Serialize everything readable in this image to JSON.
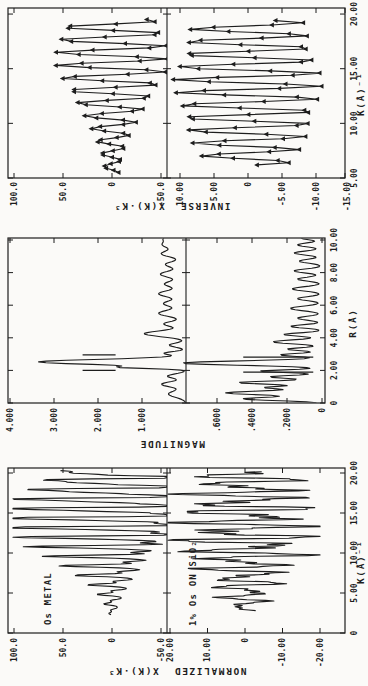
{
  "figure": {
    "kind": "scanned-exafs-figure",
    "background": "#fbfaf8",
    "ink": "#1d1d1d",
    "rotation_note": "figure printed rotated 90deg counterclockwise on the page"
  },
  "chart_data": [
    {
      "id": "normalized",
      "type": "line",
      "x_label": "K(Å)⁻¹",
      "x_range": [
        0,
        20.6
      ],
      "x_ticks": [
        0,
        5,
        10,
        15,
        20
      ],
      "x_tick_labels": [
        "0",
        "5.00",
        "10.00",
        "15.00",
        "20.00"
      ],
      "y_label": "NORMALIZED  X(K)·K³",
      "subplots": [
        {
          "id": "os-metal",
          "annotation": "Os METAL",
          "y_ticks": [
            100,
            50,
            0,
            -50
          ],
          "y_tick_labels": [
            "100.0",
            "50.0",
            "0",
            "-50.0"
          ],
          "y_range": [
            101.9,
            -56.1
          ],
          "series": {
            "kind": "exafs-oscillation",
            "k": [
              2.3,
              20.3,
              0.08
            ],
            "components": [
              [
                1.17,
                1.0,
                0.4
              ],
              [
                0.6,
                0.5,
                2.0
              ],
              [
                0.4,
                0.22,
                1.1
              ]
            ],
            "envelope": [
              [
                2.3,
                2
              ],
              [
                3,
                4
              ],
              [
                4,
                7
              ],
              [
                5,
                11
              ],
              [
                6,
                16
              ],
              [
                7,
                22
              ],
              [
                8,
                30
              ],
              [
                9,
                38
              ],
              [
                10,
                47
              ],
              [
                11,
                58
              ],
              [
                12,
                70
              ],
              [
                13,
                82
              ],
              [
                14,
                92
              ],
              [
                15,
                97
              ],
              [
                16,
                90
              ],
              [
                17,
                84
              ],
              [
                18,
                80
              ],
              [
                19,
                74
              ],
              [
                20.3,
                64
              ]
            ],
            "clamp": [
              -56,
              101
            ]
          }
        },
        {
          "id": "os-on-sio2",
          "annotation": "1% Os ON SiO₂",
          "y_ticks": [
            20,
            10,
            0,
            -10,
            -20
          ],
          "y_tick_labels": [
            "20.00",
            "10.00",
            "0",
            "-10.00",
            "-20.00"
          ],
          "y_range": [
            20.8,
            -26.7
          ],
          "series": {
            "kind": "exafs-oscillation",
            "k": [
              2.8,
              20.2,
              0.08
            ],
            "components": [
              [
                1.17,
                1.0,
                2.6
              ],
              [
                0.72,
                0.55,
                0.9
              ],
              [
                0.3,
                0.35,
                2.2
              ]
            ],
            "envelope": [
              [
                2.8,
                2.5
              ],
              [
                4,
                4.5
              ],
              [
                6,
                6.5
              ],
              [
                8,
                9
              ],
              [
                10,
                12
              ],
              [
                12,
                14.5
              ],
              [
                14,
                14.5
              ],
              [
                15,
                13.5
              ],
              [
                16,
                13
              ],
              [
                17,
                12.5
              ],
              [
                18,
                12
              ],
              [
                19,
                11
              ],
              [
                20.2,
                9.5
              ]
            ],
            "clamp": [
              -20,
              20.5
            ]
          }
        }
      ]
    },
    {
      "id": "magnitude",
      "type": "line",
      "x_label": "R(Å)",
      "x_range": [
        0,
        10.12
      ],
      "x_ticks": [
        0,
        2,
        4,
        6,
        8,
        10
      ],
      "x_tick_labels": [
        "0",
        "2.00",
        "4.00",
        "6.00",
        "8.00",
        "10.00"
      ],
      "y_label": "MAGNITUDE",
      "subplots": [
        {
          "id": "os-metal-ft",
          "annotation": "",
          "y_ticks": [
            4,
            3,
            2,
            1
          ],
          "y_tick_labels": [
            "4.000",
            "3.000",
            "2.000",
            "1.000"
          ],
          "y_range": [
            4.05,
            0
          ],
          "series": {
            "kind": "gaussian-peaks",
            "r": [
              0.02,
              10.12,
              0.05
            ],
            "peaks": [
              [
                0.55,
                0.4,
                0.2
              ],
              [
                1.15,
                0.55,
                0.16
              ],
              [
                1.65,
                0.42,
                0.13
              ],
              [
                2.18,
                1.25,
                0.07
              ],
              [
                2.52,
                3.35,
                0.155
              ],
              [
                3.05,
                0.5,
                0.1
              ],
              [
                3.55,
                0.38,
                0.13
              ],
              [
                4.25,
                0.95,
                0.18
              ],
              [
                4.85,
                0.5,
                0.16
              ],
              [
                5.5,
                0.62,
                0.2
              ],
              [
                6.1,
                0.5,
                0.18
              ],
              [
                6.7,
                0.62,
                0.2
              ],
              [
                7.3,
                0.48,
                0.18
              ],
              [
                7.9,
                0.58,
                0.2
              ],
              [
                8.5,
                0.46,
                0.18
              ],
              [
                9.15,
                0.55,
                0.2
              ],
              [
                9.7,
                0.5,
                0.2
              ],
              [
                10.12,
                0.45,
                0.18
              ]
            ]
          },
          "window_bars": [
            {
              "r": 2.0,
              "y": [
                1.6,
                2.35
              ]
            },
            {
              "r": 2.95,
              "y": [
                1.6,
                2.35
              ]
            }
          ]
        },
        {
          "id": "os-on-sio2-ft",
          "annotation": "",
          "y_ticks": [
            0.6,
            0.4,
            0.2,
            0
          ],
          "y_tick_labels": [
            ".6000",
            ".4000",
            ".2000",
            "0"
          ],
          "y_range": [
            0.78,
            -0.02
          ],
          "series": {
            "kind": "gaussian-peaks",
            "r": [
              0.02,
              10.12,
              0.05
            ],
            "peaks": [
              [
                0.25,
                0.45,
                0.1
              ],
              [
                0.62,
                0.55,
                0.12
              ],
              [
                0.95,
                0.32,
                0.08
              ],
              [
                1.25,
                0.48,
                0.1
              ],
              [
                1.6,
                0.3,
                0.09
              ],
              [
                1.95,
                0.36,
                0.08
              ],
              [
                2.45,
                0.8,
                0.13
              ],
              [
                2.95,
                0.24,
                0.09
              ],
              [
                3.3,
                0.2,
                0.09
              ],
              [
                3.75,
                0.28,
                0.12
              ],
              [
                4.2,
                0.22,
                0.1
              ],
              [
                4.7,
                0.18,
                0.1
              ],
              [
                5.2,
                0.14,
                0.12
              ],
              [
                5.8,
                0.18,
                0.14
              ],
              [
                6.4,
                0.14,
                0.12
              ],
              [
                7.0,
                0.17,
                0.13
              ],
              [
                7.6,
                0.14,
                0.12
              ],
              [
                8.1,
                0.16,
                0.12
              ],
              [
                8.7,
                0.13,
                0.12
              ],
              [
                9.2,
                0.16,
                0.12
              ],
              [
                9.7,
                0.14,
                0.12
              ],
              [
                10.12,
                0.12,
                0.1
              ]
            ]
          },
          "window_bars": [
            {
              "r": 1.9,
              "y": [
                0.05,
                0.45
              ]
            },
            {
              "r": 2.82,
              "y": [
                0.05,
                0.45
              ]
            }
          ]
        }
      ]
    },
    {
      "id": "inverse",
      "type": "line+marker",
      "x_label": "K(Å)⁻¹",
      "x_range": [
        5,
        20.55
      ],
      "x_ticks": [
        5,
        10,
        15,
        20
      ],
      "x_tick_labels": [
        "5.00",
        "10.00",
        "15.00",
        "20.00"
      ],
      "y_label": "INVERSE  X(K)·K³",
      "marker": "filled-triangle-up",
      "subplots": [
        {
          "id": "os-metal-inverse",
          "annotation": "",
          "y_ticks": [
            100,
            50,
            0,
            -50
          ],
          "y_tick_labels": [
            "100.0",
            "50.0",
            "0",
            "-50.0"
          ],
          "y_range": [
            106.1,
            -56.1
          ],
          "series": {
            "kind": "exafs-oscillation",
            "k": [
              5.5,
              19.6,
              0.2
            ],
            "components": [
              [
                1.16,
                1.0,
                0.3
              ]
            ],
            "envelope": [
              [
                5.5,
                7
              ],
              [
                7,
                10
              ],
              [
                8,
                14
              ],
              [
                9,
                18
              ],
              [
                10,
                24
              ],
              [
                11,
                30
              ],
              [
                12,
                38
              ],
              [
                13,
                45
              ],
              [
                14,
                52
              ],
              [
                15,
                57
              ],
              [
                16,
                58
              ],
              [
                17,
                57
              ],
              [
                18,
                54
              ],
              [
                19,
                50
              ],
              [
                19.6,
                45
              ]
            ],
            "clamp": [
              -56,
              100
            ]
          }
        },
        {
          "id": "os-on-sio2-inverse",
          "annotation": "",
          "y_ticks": [
            10,
            5,
            0,
            -5,
            -10,
            -15
          ],
          "y_tick_labels": [
            "10.00",
            "5.00",
            "0",
            "-5.00",
            "-10.00",
            "-15.00"
          ],
          "y_range": [
            11.9,
            -14.3
          ],
          "series": {
            "kind": "exafs-oscillation",
            "k": [
              6.2,
              19.4,
              0.2
            ],
            "components": [
              [
                1.16,
                1.0,
                1.2
              ]
            ],
            "envelope": [
              [
                6.2,
                6
              ],
              [
                8,
                8
              ],
              [
                10,
                9.5
              ],
              [
                12,
                10.5
              ],
              [
                14,
                11
              ],
              [
                16,
                10
              ],
              [
                18,
                9
              ],
              [
                19.4,
                8
              ]
            ],
            "clamp": [
              -14,
              11.5
            ]
          }
        }
      ]
    }
  ]
}
